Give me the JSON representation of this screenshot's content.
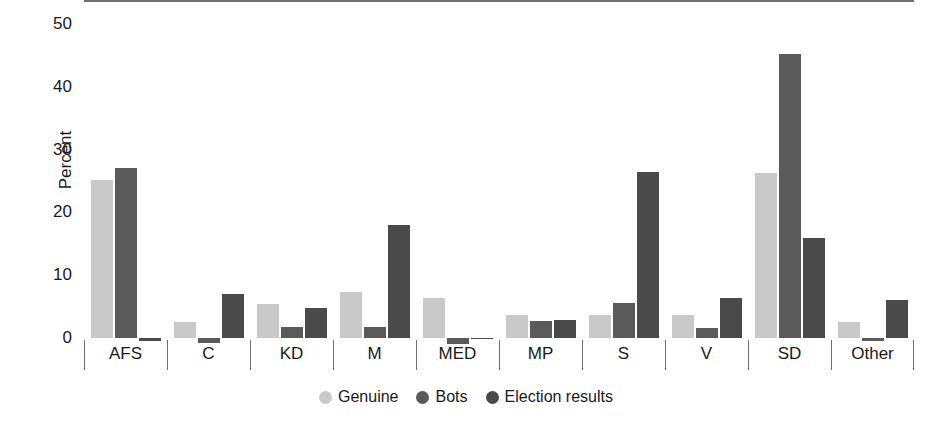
{
  "chart_data": {
    "type": "bar",
    "title": "",
    "xlabel": "",
    "ylabel": "Percent",
    "ylim": [
      -2,
      50
    ],
    "yticks": [
      0,
      10,
      20,
      30,
      40,
      50
    ],
    "ytick_labels": [
      "0",
      "10",
      "20",
      "30",
      "40",
      "50"
    ],
    "grid": false,
    "legend_position": "bottom",
    "categories": [
      "AFS",
      "C",
      "KD",
      "M",
      "MED",
      "MP",
      "S",
      "V",
      "SD",
      "Other"
    ],
    "series": [
      {
        "name": "Genuine",
        "color": "#c9c9c9",
        "values": [
          25.1,
          2.5,
          5.4,
          7.3,
          6.4,
          3.6,
          3.7,
          3.6,
          26.3,
          2.6
        ]
      },
      {
        "name": "Bots",
        "color": "#5a5a5a",
        "values": [
          27.1,
          -0.8,
          1.8,
          1.8,
          -0.9,
          2.7,
          5.5,
          1.6,
          45.2,
          -0.5
        ]
      },
      {
        "name": "Election results",
        "color": "#4a4a4a",
        "values": [
          -0.4,
          7.0,
          4.7,
          18.0,
          0.0,
          2.9,
          26.5,
          6.4,
          16.0,
          6.0
        ]
      }
    ]
  },
  "legend": {
    "items": [
      {
        "label": "Genuine",
        "color": "#c9c9c9"
      },
      {
        "label": "Bots",
        "color": "#5a5a5a"
      },
      {
        "label": "Election results",
        "color": "#4a4a4a"
      }
    ]
  },
  "axes": {
    "y_title": "Percent"
  }
}
